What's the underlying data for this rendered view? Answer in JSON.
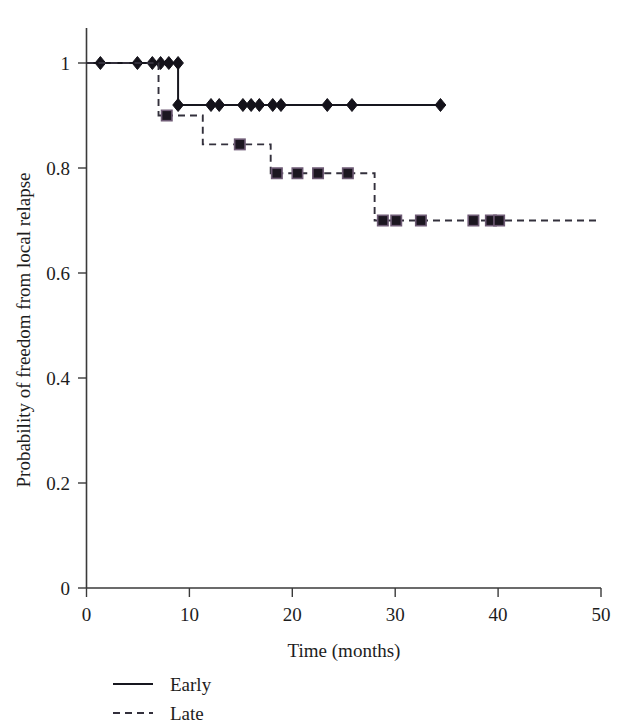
{
  "figure": {
    "background_color": "#ffffff",
    "axis_color": "#3a3a3a",
    "text_color": "#1d1d1d"
  },
  "chart_data": {
    "type": "line",
    "subtype": "kaplan-meier-step",
    "title": "",
    "xlabel": "Time (months)",
    "ylabel": "Probability of freedom from local relapse",
    "xlim": [
      0,
      50
    ],
    "ylim": [
      0,
      1
    ],
    "xticks": [
      0,
      10,
      20,
      30,
      40,
      50
    ],
    "xtick_labels": [
      "0",
      "10",
      "20",
      "30",
      "40",
      "50"
    ],
    "yticks": [
      0,
      0.2,
      0.4,
      0.6,
      0.8,
      1
    ],
    "ytick_labels": [
      "0",
      "0.2",
      "0.4",
      "0.6",
      "0.8",
      "1"
    ],
    "grid": false,
    "legend_position": "below-left",
    "series": [
      {
        "name": "Early",
        "line_style": "solid",
        "marker": "diamond",
        "color": "#17171f",
        "steps": [
          {
            "x": 0,
            "y": 1
          },
          {
            "x": 8.9,
            "y": 1
          },
          {
            "x": 8.9,
            "y": 0.92
          },
          {
            "x": 34.4,
            "y": 0.92
          }
        ],
        "censored_points": [
          {
            "x": 1.35,
            "y": 1
          },
          {
            "x": 4.95,
            "y": 1
          },
          {
            "x": 6.4,
            "y": 1
          },
          {
            "x": 7.2,
            "y": 1
          },
          {
            "x": 8.0,
            "y": 1
          },
          {
            "x": 8.9,
            "y": 1
          },
          {
            "x": 8.9,
            "y": 0.92
          },
          {
            "x": 12.1,
            "y": 0.92
          },
          {
            "x": 12.9,
            "y": 0.92
          },
          {
            "x": 15.2,
            "y": 0.92
          },
          {
            "x": 16.0,
            "y": 0.92
          },
          {
            "x": 16.8,
            "y": 0.92
          },
          {
            "x": 18.1,
            "y": 0.92
          },
          {
            "x": 18.9,
            "y": 0.92
          },
          {
            "x": 23.4,
            "y": 0.92
          },
          {
            "x": 25.8,
            "y": 0.92
          },
          {
            "x": 34.4,
            "y": 0.92
          }
        ]
      },
      {
        "name": "Late",
        "line_style": "dashed",
        "marker": "square",
        "color": "#33303c",
        "steps": [
          {
            "x": 0,
            "y": 1
          },
          {
            "x": 7.0,
            "y": 1
          },
          {
            "x": 7.0,
            "y": 0.9
          },
          {
            "x": 11.3,
            "y": 0.9
          },
          {
            "x": 11.3,
            "y": 0.845
          },
          {
            "x": 17.9,
            "y": 0.845
          },
          {
            "x": 17.9,
            "y": 0.79
          },
          {
            "x": 28.0,
            "y": 0.79
          },
          {
            "x": 28.0,
            "y": 0.7
          },
          {
            "x": 50,
            "y": 0.7
          }
        ],
        "censored_points": [
          {
            "x": 7.8,
            "y": 0.9
          },
          {
            "x": 14.9,
            "y": 0.845
          },
          {
            "x": 18.5,
            "y": 0.79
          },
          {
            "x": 20.5,
            "y": 0.79
          },
          {
            "x": 22.5,
            "y": 0.79
          },
          {
            "x": 25.4,
            "y": 0.79
          },
          {
            "x": 28.8,
            "y": 0.7
          },
          {
            "x": 30.1,
            "y": 0.7
          },
          {
            "x": 32.5,
            "y": 0.7
          },
          {
            "x": 37.6,
            "y": 0.7
          },
          {
            "x": 39.3,
            "y": 0.7
          },
          {
            "x": 40.1,
            "y": 0.7
          }
        ]
      }
    ],
    "legend": [
      {
        "label": "Early",
        "line_style": "solid"
      },
      {
        "label": "Late",
        "line_style": "dashed"
      }
    ]
  }
}
